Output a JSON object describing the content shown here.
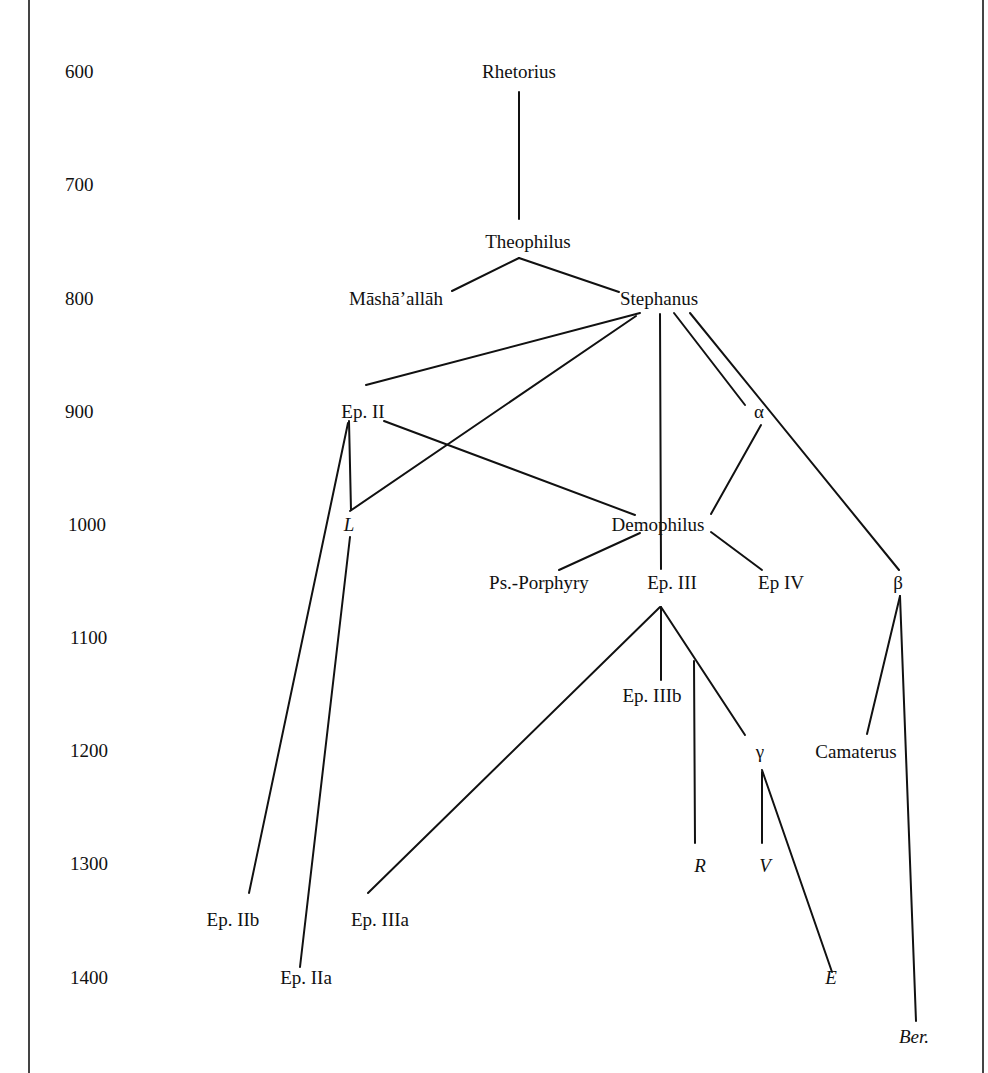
{
  "diagram": {
    "type": "stemma",
    "axis": {
      "label": "",
      "ticks": [
        "600",
        "700",
        "800",
        "900",
        "1000",
        "1100",
        "1200",
        "1300",
        "1400"
      ]
    },
    "nodes": [
      {
        "id": "rhetorius",
        "label": "Rhetorius",
        "italic": false
      },
      {
        "id": "theophilus",
        "label": "Theophilus",
        "italic": false
      },
      {
        "id": "mashaallah",
        "label": "Māshā’allāh",
        "italic": false
      },
      {
        "id": "stephanus",
        "label": "Stephanus",
        "italic": false
      },
      {
        "id": "ep2",
        "label": "Ep. II",
        "italic": false
      },
      {
        "id": "alpha",
        "label": "α",
        "italic": false
      },
      {
        "id": "L",
        "label": "L",
        "italic": true
      },
      {
        "id": "demophilus",
        "label": "Demophilus",
        "italic": false
      },
      {
        "id": "psporphyry",
        "label": "Ps.-Porphyry",
        "italic": false
      },
      {
        "id": "ep3",
        "label": "Ep. III",
        "italic": false
      },
      {
        "id": "ep4",
        "label": "Ep IV",
        "italic": false
      },
      {
        "id": "beta",
        "label": "β",
        "italic": false
      },
      {
        "id": "ep3b",
        "label": "Ep. IIIb",
        "italic": false
      },
      {
        "id": "gamma",
        "label": "γ",
        "italic": false
      },
      {
        "id": "camaterus",
        "label": "Camaterus",
        "italic": false
      },
      {
        "id": "R",
        "label": "R",
        "italic": true
      },
      {
        "id": "V",
        "label": "V",
        "italic": true
      },
      {
        "id": "ep2b",
        "label": "Ep. IIb",
        "italic": false
      },
      {
        "id": "ep3a",
        "label": "Ep. IIIa",
        "italic": false
      },
      {
        "id": "ep2a",
        "label": "Ep. IIa",
        "italic": false
      },
      {
        "id": "E",
        "label": "E",
        "italic": true
      },
      {
        "id": "ber",
        "label": "Ber.",
        "italic": true
      }
    ],
    "edges": [
      {
        "from": "rhetorius",
        "to": "theophilus"
      },
      {
        "from": "theophilus",
        "to": "mashaallah"
      },
      {
        "from": "theophilus",
        "to": "stephanus"
      },
      {
        "from": "stephanus",
        "to": "ep2"
      },
      {
        "from": "stephanus",
        "to": "L"
      },
      {
        "from": "stephanus",
        "to": "ep3"
      },
      {
        "from": "stephanus",
        "to": "alpha"
      },
      {
        "from": "stephanus",
        "to": "beta"
      },
      {
        "from": "ep2",
        "to": "L"
      },
      {
        "from": "ep2",
        "to": "ep2b"
      },
      {
        "from": "ep2",
        "to": "demophilus"
      },
      {
        "from": "alpha",
        "to": "demophilus"
      },
      {
        "from": "L",
        "to": "ep2a"
      },
      {
        "from": "demophilus",
        "to": "psporphyry"
      },
      {
        "from": "demophilus",
        "to": "ep4"
      },
      {
        "from": "ep3",
        "to": "ep3a"
      },
      {
        "from": "ep3",
        "to": "ep3b"
      },
      {
        "from": "ep3",
        "to": "gamma"
      },
      {
        "from": "ep3",
        "to": "R"
      },
      {
        "from": "beta",
        "to": "camaterus"
      },
      {
        "from": "beta",
        "to": "ber"
      },
      {
        "from": "gamma",
        "to": "V"
      },
      {
        "from": "gamma",
        "to": "E"
      }
    ]
  }
}
